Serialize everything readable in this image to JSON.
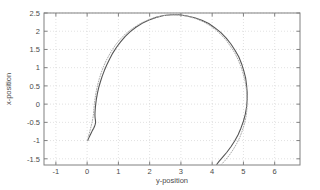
{
  "chart_data": {
    "type": "line",
    "title": "",
    "xlabel": "y-position",
    "ylabel": "x-position",
    "xlim": [
      -1.38,
      6.81
    ],
    "ylim": [
      -1.67,
      2.5
    ],
    "xticks": [
      -1,
      0,
      1,
      2,
      3,
      4,
      5,
      6
    ],
    "xtick_labels": [
      "-1",
      "0",
      "1",
      "2",
      "3",
      "4",
      "5",
      "6"
    ],
    "yticks": [
      -1.5,
      -1,
      -0.5,
      0,
      0.5,
      1,
      1.5,
      2,
      2.5
    ],
    "ytick_labels": [
      "-1.5",
      "-1",
      "-0.5",
      "0",
      "0.5",
      "1",
      "1.5",
      "2",
      "2.5"
    ],
    "grid": true,
    "grid_style": "dotted",
    "grid_color": "#cccccc",
    "axis_color": "#808080",
    "background": "#ffffff",
    "legend": "none",
    "series": [
      {
        "name": "solid-trajectory",
        "style": "solid",
        "color": "#555555",
        "points": [
          [
            0.02,
            -1.0
          ],
          [
            0.05,
            -0.93
          ],
          [
            0.09,
            -0.86
          ],
          [
            0.13,
            -0.79
          ],
          [
            0.17,
            -0.72
          ],
          [
            0.21,
            -0.66
          ],
          [
            0.24,
            -0.6
          ],
          [
            0.26,
            -0.55
          ],
          [
            0.27,
            -0.5
          ],
          [
            0.265,
            -0.44
          ],
          [
            0.255,
            -0.38
          ],
          [
            0.25,
            -0.32
          ],
          [
            0.25,
            -0.26
          ],
          [
            0.255,
            -0.18
          ],
          [
            0.265,
            -0.08
          ],
          [
            0.28,
            0.04
          ],
          [
            0.3,
            0.16
          ],
          [
            0.33,
            0.3
          ],
          [
            0.37,
            0.45
          ],
          [
            0.42,
            0.6
          ],
          [
            0.48,
            0.76
          ],
          [
            0.55,
            0.92
          ],
          [
            0.63,
            1.08
          ],
          [
            0.72,
            1.24
          ],
          [
            0.82,
            1.4
          ],
          [
            0.94,
            1.56
          ],
          [
            1.07,
            1.71
          ],
          [
            1.22,
            1.86
          ],
          [
            1.38,
            1.99
          ],
          [
            1.56,
            2.11
          ],
          [
            1.76,
            2.22
          ],
          [
            1.98,
            2.31
          ],
          [
            2.21,
            2.38
          ],
          [
            2.45,
            2.43
          ],
          [
            2.7,
            2.45
          ],
          [
            2.95,
            2.45
          ],
          [
            3.2,
            2.42
          ],
          [
            3.44,
            2.37
          ],
          [
            3.67,
            2.3
          ],
          [
            3.89,
            2.21
          ],
          [
            4.09,
            2.09
          ],
          [
            4.28,
            1.96
          ],
          [
            4.45,
            1.81
          ],
          [
            4.6,
            1.65
          ],
          [
            4.73,
            1.48
          ],
          [
            4.85,
            1.3
          ],
          [
            4.94,
            1.11
          ],
          [
            5.01,
            0.92
          ],
          [
            5.07,
            0.72
          ],
          [
            5.1,
            0.52
          ],
          [
            5.12,
            0.32
          ],
          [
            5.12,
            0.12
          ],
          [
            5.1,
            -0.08
          ],
          [
            5.06,
            -0.28
          ],
          [
            5.0,
            -0.47
          ],
          [
            4.92,
            -0.66
          ],
          [
            4.83,
            -0.84
          ],
          [
            4.72,
            -1.01
          ],
          [
            4.6,
            -1.17
          ],
          [
            4.47,
            -1.32
          ],
          [
            4.33,
            -1.46
          ],
          [
            4.22,
            -1.57
          ],
          [
            4.15,
            -1.65
          ]
        ]
      },
      {
        "name": "dotted-trajectory",
        "style": "dotted",
        "color": "#aaaaaa",
        "points": [
          [
            0.02,
            -1.0
          ],
          [
            0.04,
            -0.9
          ],
          [
            0.07,
            -0.8
          ],
          [
            0.1,
            -0.7
          ],
          [
            0.13,
            -0.6
          ],
          [
            0.16,
            -0.5
          ],
          [
            0.18,
            -0.4
          ],
          [
            0.2,
            -0.3
          ],
          [
            0.21,
            -0.2
          ],
          [
            0.22,
            -0.1
          ],
          [
            0.23,
            0.0
          ],
          [
            0.25,
            0.12
          ],
          [
            0.27,
            0.25
          ],
          [
            0.3,
            0.39
          ],
          [
            0.34,
            0.54
          ],
          [
            0.39,
            0.7
          ],
          [
            0.45,
            0.86
          ],
          [
            0.52,
            1.02
          ],
          [
            0.6,
            1.18
          ],
          [
            0.7,
            1.34
          ],
          [
            0.81,
            1.5
          ],
          [
            0.93,
            1.65
          ],
          [
            1.07,
            1.79
          ],
          [
            1.23,
            1.93
          ],
          [
            1.41,
            2.05
          ],
          [
            1.6,
            2.16
          ],
          [
            1.81,
            2.26
          ],
          [
            2.03,
            2.34
          ],
          [
            2.27,
            2.4
          ],
          [
            2.52,
            2.44
          ],
          [
            2.77,
            2.45
          ],
          [
            3.02,
            2.44
          ],
          [
            3.26,
            2.4
          ],
          [
            3.49,
            2.34
          ],
          [
            3.71,
            2.26
          ],
          [
            3.92,
            2.16
          ],
          [
            4.11,
            2.04
          ],
          [
            4.29,
            1.9
          ],
          [
            4.45,
            1.75
          ],
          [
            4.59,
            1.58
          ],
          [
            4.72,
            1.41
          ],
          [
            4.83,
            1.22
          ],
          [
            4.92,
            1.03
          ],
          [
            4.99,
            0.84
          ],
          [
            5.05,
            0.64
          ],
          [
            5.09,
            0.44
          ],
          [
            5.11,
            0.24
          ],
          [
            5.12,
            0.04
          ],
          [
            5.11,
            -0.16
          ],
          [
            5.08,
            -0.36
          ],
          [
            5.03,
            -0.55
          ],
          [
            4.96,
            -0.74
          ],
          [
            4.88,
            -0.92
          ],
          [
            4.78,
            -1.09
          ],
          [
            4.67,
            -1.25
          ],
          [
            4.55,
            -1.4
          ],
          [
            4.42,
            -1.54
          ],
          [
            4.3,
            -1.65
          ]
        ]
      }
    ]
  }
}
